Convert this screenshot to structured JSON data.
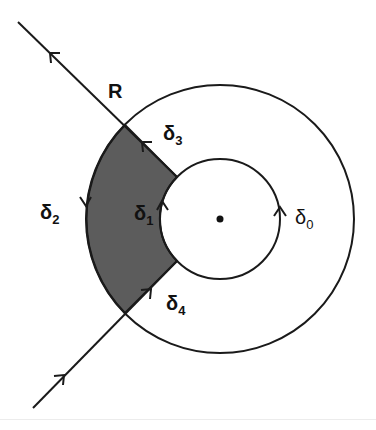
{
  "diagram": {
    "type": "contour-keyhole",
    "center": {
      "x": 220,
      "y": 219,
      "marker": "dot"
    },
    "inner_radius": 60,
    "outer_radius": 134,
    "shade_color": "#5c5c5c",
    "stroke_color": "#1a1a1a",
    "labels": {
      "R": {
        "base": "R",
        "sub": ""
      },
      "d0": {
        "base": "δ",
        "sub": "0"
      },
      "d1": {
        "base": "δ",
        "sub": "1"
      },
      "d2": {
        "base": "δ",
        "sub": "2"
      },
      "d3": {
        "base": "δ",
        "sub": "3"
      },
      "d4": {
        "base": "δ",
        "sub": "4"
      }
    },
    "curves": [
      {
        "name": "delta_0",
        "kind": "inner circle",
        "orientation": "counterclockwise"
      },
      {
        "name": "delta_1",
        "kind": "inner arc of shaded region",
        "direction": "up"
      },
      {
        "name": "delta_2",
        "kind": "outer arc of shaded region",
        "direction": "down"
      },
      {
        "name": "delta_3",
        "kind": "upper radial segment",
        "direction": "outward (up-left)"
      },
      {
        "name": "delta_4",
        "kind": "lower radial segment",
        "direction": "inward (up-right)"
      },
      {
        "name": "R",
        "kind": "ray through annulus",
        "direction": "from lower-left to upper-left"
      }
    ]
  }
}
